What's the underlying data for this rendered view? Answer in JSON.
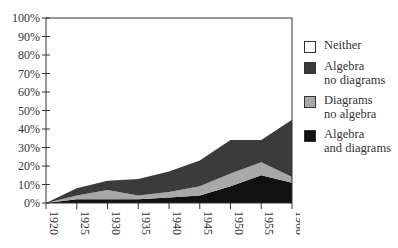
{
  "chart_data": {
    "type": "area",
    "stacked": true,
    "title": "",
    "xlabel": "",
    "ylabel": "",
    "ylim": [
      0,
      100
    ],
    "x": [
      1920,
      1925,
      1930,
      1935,
      1940,
      1945,
      1950,
      1955,
      1960
    ],
    "y_ticks": [
      "0%",
      "10%",
      "20%",
      "30%",
      "40%",
      "50%",
      "60%",
      "70%",
      "80%",
      "90%",
      "100%"
    ],
    "x_ticks": [
      "1920",
      "1925",
      "1930",
      "1935",
      "1940",
      "1945",
      "1950",
      "1955",
      "1960"
    ],
    "series": [
      {
        "name": "Algebra and diagrams",
        "color": "#111111",
        "values": [
          0,
          2,
          2,
          2,
          3,
          4,
          9,
          15,
          11
        ]
      },
      {
        "name": "Diagrams no algebra",
        "color": "#a8a8a8",
        "values": [
          0,
          2,
          5,
          2,
          3,
          5,
          7,
          7,
          3
        ]
      },
      {
        "name": "Algebra no diagrams",
        "color": "#3b3b3b",
        "values": [
          0,
          4,
          5,
          9,
          11,
          14,
          18,
          12,
          31
        ]
      },
      {
        "name": "Neither",
        "color": "#ffffff",
        "values": [
          100,
          92,
          88,
          87,
          83,
          77,
          66,
          66,
          55
        ]
      }
    ],
    "grid": false,
    "legend_position": "right"
  },
  "legend": [
    {
      "label": "Neither",
      "color": "#ffffff"
    },
    {
      "label": "Algebra\nno diagrams",
      "color": "#3b3b3b"
    },
    {
      "label": "Diagrams\nno algebra",
      "color": "#a8a8a8"
    },
    {
      "label": "Algebra\nand diagrams",
      "color": "#111111"
    }
  ]
}
